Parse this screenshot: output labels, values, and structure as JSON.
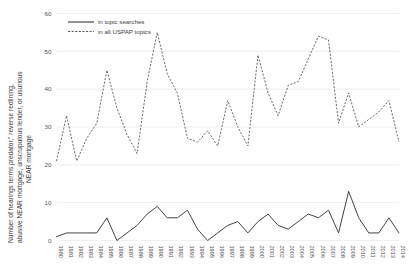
{
  "chart_data": {
    "type": "line",
    "title": "",
    "xlabel": "",
    "ylabel": "Number of hearings terms predator,\" reverse redlining, abusive NEAR mortgage, unscrupulous lender, or usurious NEAR mortgage",
    "ylabel_line1": "Number of hearings terms predator,\" reverse redlining,",
    "ylabel_line2": "abusive NEAR mortgage, unscrupulous lender, or usurious",
    "ylabel_line3": "NEAR mortgage",
    "ylim": [
      0,
      60
    ],
    "yticks": [
      0,
      10,
      20,
      30,
      40,
      50,
      60
    ],
    "grid": true,
    "legend_position": "top-left",
    "x": [
      "1980",
      "1981",
      "1982",
      "1983",
      "1984",
      "1985",
      "1986",
      "1987",
      "1988",
      "1989",
      "1990",
      "1991",
      "1992",
      "1993",
      "1994",
      "1995",
      "1996",
      "1997",
      "1998",
      "1999",
      "2000",
      "2001",
      "2002",
      "2003",
      "2004",
      "2005",
      "2006",
      "2007",
      "2008",
      "2009",
      "2010",
      "2011",
      "2012",
      "2013",
      "2014"
    ],
    "series": [
      {
        "name": "in topic searches",
        "style": "solid",
        "color": "#39393b",
        "values": [
          1,
          2,
          2,
          2,
          2,
          6,
          0,
          2,
          4,
          7,
          9,
          6,
          6,
          8,
          3,
          0,
          2,
          4,
          5,
          2,
          5,
          7,
          4,
          3,
          5,
          7,
          6,
          8,
          2,
          13,
          6,
          2,
          2,
          6,
          2
        ]
      },
      {
        "name": "in all USPAP topics",
        "style": "dashed",
        "color": "#5b5b5d",
        "values": [
          21,
          33,
          21,
          27,
          31,
          45,
          35,
          28,
          23,
          42,
          55,
          44,
          39,
          27,
          26,
          29,
          25,
          37,
          30,
          25,
          49,
          39,
          33,
          41,
          42,
          48,
          54,
          53,
          31,
          39,
          30,
          32,
          34,
          37,
          26
        ]
      }
    ]
  },
  "legend": {
    "items": [
      {
        "label": "in topic searches",
        "style": "solid"
      },
      {
        "label": "in all USPAP topics",
        "style": "dashed"
      }
    ]
  }
}
